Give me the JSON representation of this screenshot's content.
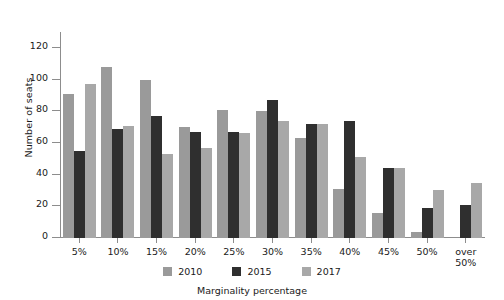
{
  "chart_data": {
    "type": "bar",
    "title": "",
    "xlabel": "Marginality percentage",
    "ylabel": "Number of seats",
    "categories": [
      "5%",
      "10%",
      "15%",
      "20%",
      "25%",
      "30%",
      "35%",
      "40%",
      "45%",
      "50%",
      "over\n50%"
    ],
    "ylim": [
      0,
      130
    ],
    "yticks": [
      0,
      20,
      40,
      60,
      80,
      100,
      120
    ],
    "grid": false,
    "legend_position": "bottom",
    "series": [
      {
        "name": "2010",
        "color": "#9a9a9a",
        "values": [
          91,
          108,
          100,
          70,
          81,
          80,
          63,
          31,
          16,
          4,
          0
        ]
      },
      {
        "name": "2015",
        "color": "#2f2f2f",
        "values": [
          55,
          69,
          77,
          67,
          67,
          87,
          72,
          74,
          44,
          19,
          21
        ]
      },
      {
        "name": "2017",
        "color": "#a8a8a8",
        "values": [
          97,
          71,
          53,
          57,
          66,
          74,
          72,
          51,
          44,
          30,
          35
        ]
      }
    ]
  },
  "legend": {
    "items": [
      {
        "label": "2010"
      },
      {
        "label": "2015"
      },
      {
        "label": "2017"
      }
    ]
  }
}
